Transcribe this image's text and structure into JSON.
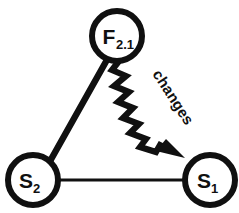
{
  "diagram": {
    "background_color": "#ffffff",
    "stroke_color": "#101010",
    "nodes": [
      {
        "id": "f21",
        "name": "node-f-2-1",
        "base_label": "F",
        "subscript": "2.1",
        "cx": 117,
        "cy": 36,
        "r": 25
      },
      {
        "id": "s2",
        "name": "node-s-2",
        "base_label": "S",
        "subscript": "2",
        "cx": 33,
        "cy": 180,
        "r": 25
      },
      {
        "id": "s1",
        "name": "node-s-1",
        "base_label": "S",
        "subscript": "1",
        "cx": 210,
        "cy": 180,
        "r": 25
      }
    ],
    "edges": [
      {
        "id": "edge-f-s2",
        "name": "edge-f21-to-s2",
        "style": "straight-thick",
        "from": "f21",
        "to": "s2",
        "label": ""
      },
      {
        "id": "edge-s2-s1",
        "name": "edge-s2-to-s1",
        "style": "straight-thin",
        "from": "s2",
        "to": "s1",
        "label": ""
      },
      {
        "id": "edge-f-s1",
        "name": "edge-f21-to-s1",
        "style": "zigzag-arrow",
        "from": "f21",
        "to": "s1",
        "label": "changes",
        "label_rotation_deg": 57
      }
    ]
  }
}
